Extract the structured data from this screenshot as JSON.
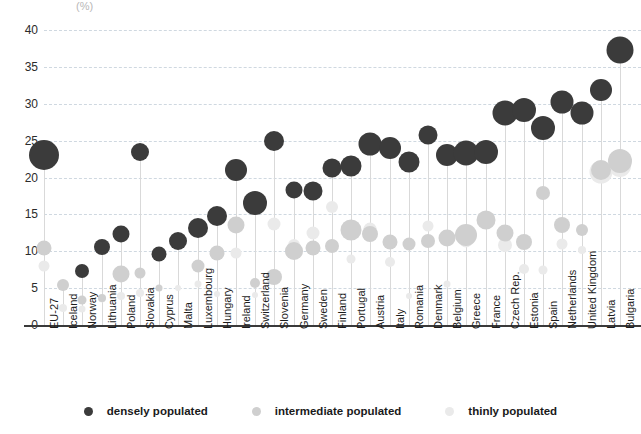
{
  "axis": {
    "unit_label": "(%)",
    "y_ticks": [
      "40",
      "35",
      "30",
      "25",
      "20",
      "15",
      "10",
      "5",
      "0"
    ],
    "y_min": 0,
    "y_max": 40,
    "y_step": 5
  },
  "legend": {
    "items": [
      {
        "label": "densely populated",
        "color": "#3b3b3b",
        "key": "dense"
      },
      {
        "label": "intermediate populated",
        "color": "#cfcfcf",
        "key": "intermediate"
      },
      {
        "label": "thinly populated",
        "color": "#eaeaea",
        "key": "thin"
      }
    ]
  },
  "chart_data": {
    "type": "scatter",
    "title": "",
    "subtitle": "",
    "xlabel": "",
    "ylabel": "(%)",
    "ylim": [
      0,
      40
    ],
    "grid": true,
    "legend_position": "bottom",
    "note": "Bubble chart: bubble area encodes relative share; y position is the percentage value.",
    "categories": [
      "EU-27",
      "Iceland",
      "Norway",
      "Lithuania",
      "Poland",
      "Slovakia",
      "Cyprus",
      "Malta",
      "Luxembourg",
      "Hungary",
      "Ireland",
      "Switzerland",
      "Slovenia",
      "Germany",
      "Sweden",
      "Finland",
      "Portugal",
      "Austria",
      "Italy",
      "Romania",
      "Denmark",
      "Belgium",
      "Greece",
      "France",
      "Czech Rep.",
      "Estonia",
      "Spain",
      "Netherlands",
      "United Kingdom",
      "Latvia",
      "Bulgaria"
    ],
    "series": [
      {
        "name": "densely populated",
        "color": "#3b3b3b",
        "values": [
          23.0,
          null,
          7.3,
          10.6,
          12.3,
          23.5,
          9.6,
          11.4,
          13.2,
          14.8,
          21.0,
          16.5,
          25.0,
          18.3,
          18.2,
          21.3,
          21.6,
          24.6,
          24.0,
          22.1,
          25.7,
          23.0,
          23.3,
          23.4,
          28.7,
          29.2,
          26.7,
          30.3,
          28.8,
          31.8,
          37.3
        ],
        "sizes": [
          30,
          0,
          14,
          16,
          17,
          18,
          15,
          18,
          20,
          20,
          22,
          24,
          20,
          17,
          19,
          19,
          21,
          23,
          22,
          21,
          19,
          22,
          25,
          24,
          25,
          24,
          24,
          23,
          23,
          22,
          27
        ]
      },
      {
        "name": "intermediate populated",
        "color": "#cfcfcf",
        "values": [
          10.5,
          5.4,
          3.4,
          3.6,
          6.9,
          7.0,
          5.0,
          null,
          8.0,
          9.7,
          13.6,
          5.7,
          6.5,
          10.1,
          10.4,
          10.7,
          12.9,
          12.3,
          11.3,
          11.0,
          11.4,
          11.8,
          12.2,
          14.2,
          12.5,
          11.3,
          17.9,
          13.6,
          12.9,
          21.0,
          22.3
        ],
        "sizes": [
          15,
          12,
          9,
          8,
          17,
          11,
          7,
          0,
          13,
          15,
          17,
          10,
          16,
          18,
          15,
          14,
          21,
          16,
          15,
          13,
          14,
          17,
          22,
          19,
          17,
          16,
          14,
          16,
          12,
          20,
          24
        ]
      },
      {
        "name": "thinly populated",
        "color": "#eaeaea",
        "values": [
          8.0,
          2.3,
          2.2,
          3.5,
          4.0,
          4.4,
          null,
          5.0,
          5.5,
          4.2,
          9.8,
          4.1,
          13.7,
          10.9,
          12.5,
          16.0,
          8.9,
          13.0,
          8.5,
          3.9,
          13.4,
          5.6,
          11.4,
          14.4,
          10.8,
          7.6,
          7.5,
          11.0,
          10.2,
          20.8,
          21.5
        ],
        "sizes": [
          11,
          8,
          7,
          7,
          8,
          8,
          0,
          6,
          7,
          6,
          11,
          6,
          13,
          12,
          13,
          12,
          9,
          13,
          10,
          6,
          11,
          7,
          13,
          12,
          14,
          10,
          9,
          11,
          8,
          23,
          22
        ]
      }
    ]
  }
}
